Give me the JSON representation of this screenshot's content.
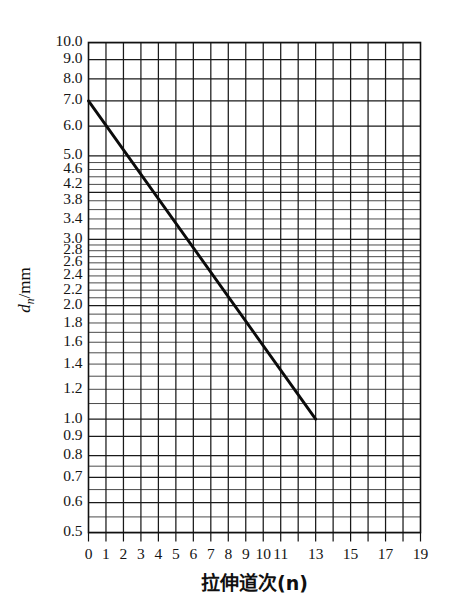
{
  "chart_data": {
    "type": "line",
    "title": "",
    "xlabel": "拉伸道次(n)",
    "ylabel": "d_n/mm",
    "ylabel_main": "d",
    "ylabel_sub": "n",
    "ylabel_unit": "/mm",
    "yscale": "log",
    "xscale": "linear",
    "grid": true,
    "legend": "none",
    "xlim": [
      0,
      19
    ],
    "ylim": [
      0.5,
      10.0
    ],
    "x": [
      0,
      1,
      2,
      3,
      4,
      5,
      6,
      7,
      8,
      9,
      10,
      11,
      12,
      13
    ],
    "values": [
      7.0,
      6.36,
      5.78,
      5.25,
      4.77,
      4.33,
      3.94,
      3.58,
      3.25,
      2.95,
      2.68,
      2.44,
      2.21,
      2.0
    ],
    "series": [
      {
        "name": "拉伸道次-线径",
        "points": [
          {
            "x": 0,
            "y": 7.0
          },
          {
            "x": 13,
            "y": 1.0
          }
        ],
        "description": "从 (0, 7.0) 到 (13, 1.0) 的直线(对数坐标)"
      }
    ],
    "x_ticks_all": [
      0,
      1,
      2,
      3,
      4,
      5,
      6,
      7,
      8,
      9,
      10,
      11,
      12,
      13,
      14,
      15,
      16,
      17,
      18,
      19
    ],
    "x_tick_labels": [
      {
        "x": 0,
        "label": "0"
      },
      {
        "x": 1,
        "label": "1"
      },
      {
        "x": 2,
        "label": "2"
      },
      {
        "x": 3,
        "label": "3"
      },
      {
        "x": 4,
        "label": "4"
      },
      {
        "x": 5,
        "label": "5"
      },
      {
        "x": 6,
        "label": "6"
      },
      {
        "x": 7,
        "label": "7"
      },
      {
        "x": 8,
        "label": "8"
      },
      {
        "x": 9,
        "label": "9"
      },
      {
        "x": 10,
        "label": "10"
      },
      {
        "x": 11,
        "label": "11"
      },
      {
        "x": 13,
        "label": "13"
      },
      {
        "x": 15,
        "label": "15"
      },
      {
        "x": 17,
        "label": "17"
      },
      {
        "x": 19,
        "label": "19"
      }
    ],
    "y_tick_labels": [
      {
        "y": 10.0,
        "label": "10.0"
      },
      {
        "y": 9.0,
        "label": "9.0"
      },
      {
        "y": 8.0,
        "label": "8.0"
      },
      {
        "y": 7.0,
        "label": "7.0"
      },
      {
        "y": 6.0,
        "label": "6.0"
      },
      {
        "y": 5.0,
        "label": "5.0"
      },
      {
        "y": 4.6,
        "label": "4.6"
      },
      {
        "y": 4.2,
        "label": "4.2"
      },
      {
        "y": 3.8,
        "label": "3.8"
      },
      {
        "y": 3.4,
        "label": "3.4"
      },
      {
        "y": 3.0,
        "label": "3.0"
      },
      {
        "y": 2.8,
        "label": "2.8"
      },
      {
        "y": 2.6,
        "label": "2.6"
      },
      {
        "y": 2.4,
        "label": "2.4"
      },
      {
        "y": 2.2,
        "label": "2.2"
      },
      {
        "y": 2.0,
        "label": "2.0"
      },
      {
        "y": 1.8,
        "label": "1.8"
      },
      {
        "y": 1.6,
        "label": "1.6"
      },
      {
        "y": 1.4,
        "label": "1.4"
      },
      {
        "y": 1.2,
        "label": "1.2"
      },
      {
        "y": 1.0,
        "label": "1.0"
      },
      {
        "y": 0.9,
        "label": "0.9"
      },
      {
        "y": 0.8,
        "label": "0.8"
      },
      {
        "y": 0.7,
        "label": "0.7"
      },
      {
        "y": 0.6,
        "label": "0.6"
      },
      {
        "y": 0.5,
        "label": "0.5"
      }
    ],
    "y_gridlines": [
      10.0,
      9.0,
      8.0,
      7.0,
      6.0,
      5.0,
      4.8,
      4.6,
      4.4,
      4.2,
      4.0,
      3.8,
      3.6,
      3.4,
      3.2,
      3.0,
      2.9,
      2.8,
      2.7,
      2.6,
      2.5,
      2.4,
      2.3,
      2.2,
      2.1,
      2.0,
      1.9,
      1.8,
      1.7,
      1.6,
      1.5,
      1.4,
      1.3,
      1.2,
      1.1,
      1.0,
      0.9,
      0.8,
      0.75,
      0.7,
      0.65,
      0.6,
      0.55,
      0.5
    ],
    "y_major_gridlines": [
      10.0,
      9.0,
      8.0,
      7.0,
      6.0,
      5.0,
      4.0,
      3.0,
      2.0,
      1.0,
      0.9,
      0.8,
      0.7,
      0.6,
      0.5
    ],
    "colors": {
      "line": "#0b0b0b",
      "grid": "#2b2b2b",
      "frame": "#111111",
      "background": "#ffffff",
      "text": "#141414"
    }
  }
}
